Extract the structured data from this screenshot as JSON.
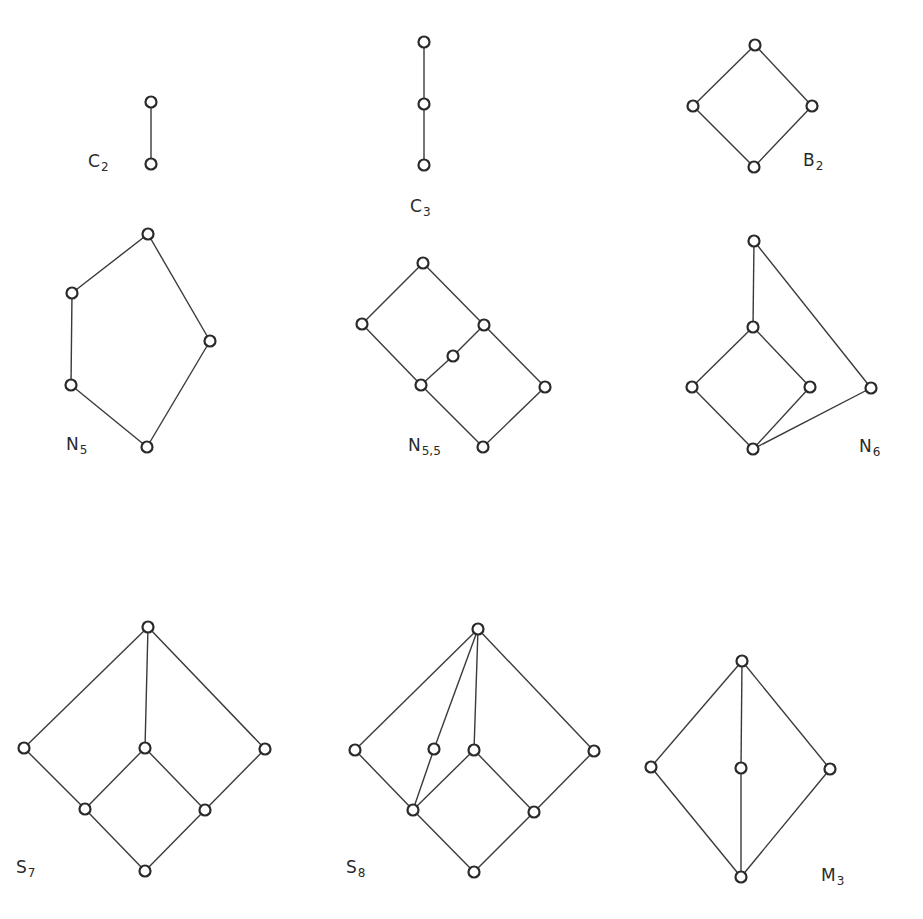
{
  "figure": {
    "diagrams": [
      {
        "id": "C2",
        "label": "C",
        "subscript": "2",
        "nodes": [
          "bottom",
          "top"
        ],
        "edges": [
          [
            "bottom",
            "top"
          ]
        ]
      },
      {
        "id": "C3",
        "label": "C",
        "subscript": "3",
        "nodes": [
          "bottom",
          "middle",
          "top"
        ],
        "edges": [
          [
            "bottom",
            "middle"
          ],
          [
            "middle",
            "top"
          ]
        ]
      },
      {
        "id": "B2",
        "label": "B",
        "subscript": "2",
        "nodes": [
          "bottom",
          "left",
          "right",
          "top"
        ],
        "edges": [
          [
            "bottom",
            "left"
          ],
          [
            "bottom",
            "right"
          ],
          [
            "left",
            "top"
          ],
          [
            "right",
            "top"
          ]
        ]
      },
      {
        "id": "N5",
        "label": "N",
        "subscript": "5",
        "nodes": [
          "bottom",
          "lower-left",
          "upper-left",
          "right",
          "top"
        ],
        "edges": [
          [
            "bottom",
            "lower-left"
          ],
          [
            "lower-left",
            "upper-left"
          ],
          [
            "upper-left",
            "top"
          ],
          [
            "bottom",
            "right"
          ],
          [
            "right",
            "top"
          ]
        ]
      },
      {
        "id": "N55",
        "label": "N",
        "subscript": "5,5",
        "nodes": [
          "bottom",
          "center",
          "far-right",
          "left",
          "mid",
          "upper-right",
          "top"
        ],
        "edges": [
          [
            "bottom",
            "center"
          ],
          [
            "bottom",
            "far-right"
          ],
          [
            "center",
            "left"
          ],
          [
            "center",
            "mid"
          ],
          [
            "mid",
            "upper-right"
          ],
          [
            "far-right",
            "upper-right"
          ],
          [
            "left",
            "top"
          ],
          [
            "upper-right",
            "top"
          ]
        ]
      },
      {
        "id": "N6",
        "label": "N",
        "subscript": "6",
        "nodes": [
          "bottom",
          "left",
          "right",
          "far-right",
          "mid",
          "top"
        ],
        "edges": [
          [
            "bottom",
            "left"
          ],
          [
            "bottom",
            "right"
          ],
          [
            "bottom",
            "far-right"
          ],
          [
            "left",
            "mid"
          ],
          [
            "right",
            "mid"
          ],
          [
            "mid",
            "top"
          ],
          [
            "far-right",
            "top"
          ]
        ]
      },
      {
        "id": "S7",
        "label": "S",
        "subscript": "7",
        "nodes": [
          "bottom",
          "lower-left",
          "lower-right",
          "left",
          "mid",
          "right",
          "top"
        ],
        "edges": [
          [
            "bottom",
            "lower-left"
          ],
          [
            "bottom",
            "lower-right"
          ],
          [
            "lower-left",
            "left"
          ],
          [
            "lower-left",
            "mid"
          ],
          [
            "lower-right",
            "mid"
          ],
          [
            "lower-right",
            "right"
          ],
          [
            "left",
            "top"
          ],
          [
            "mid",
            "top"
          ],
          [
            "right",
            "top"
          ]
        ]
      },
      {
        "id": "S8",
        "label": "S",
        "subscript": "8",
        "nodes": [
          "bottom",
          "lower-left",
          "lower-right",
          "left",
          "inner-left",
          "mid",
          "right",
          "top"
        ],
        "edges": [
          [
            "bottom",
            "lower-left"
          ],
          [
            "bottom",
            "lower-right"
          ],
          [
            "lower-left",
            "left"
          ],
          [
            "lower-left",
            "inner-left"
          ],
          [
            "lower-left",
            "mid"
          ],
          [
            "lower-right",
            "mid"
          ],
          [
            "lower-right",
            "right"
          ],
          [
            "left",
            "top"
          ],
          [
            "inner-left",
            "top"
          ],
          [
            "mid",
            "top"
          ],
          [
            "right",
            "top"
          ]
        ]
      },
      {
        "id": "M3",
        "label": "M",
        "subscript": "3",
        "nodes": [
          "bottom",
          "left",
          "mid",
          "right",
          "top"
        ],
        "edges": [
          [
            "bottom",
            "left"
          ],
          [
            "bottom",
            "mid"
          ],
          [
            "bottom",
            "right"
          ],
          [
            "left",
            "top"
          ],
          [
            "mid",
            "top"
          ],
          [
            "right",
            "top"
          ]
        ]
      }
    ]
  }
}
